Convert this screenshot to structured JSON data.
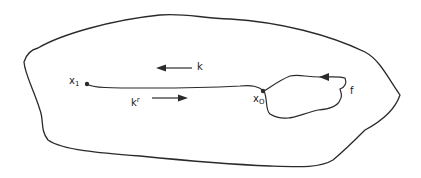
{
  "diagram": {
    "colors": {
      "stroke": "#2a2a2a",
      "background": "#ffffff"
    },
    "nodes": {
      "x1": {
        "base": "x",
        "sub": "1"
      },
      "x0": {
        "base": "x",
        "sub": "O"
      }
    },
    "labels": {
      "k": "k",
      "kr_base": "k",
      "kr_sup": "r",
      "f": "f"
    },
    "arrows": {
      "k_direction": "left",
      "kr_direction": "right",
      "f_direction": "left"
    }
  }
}
